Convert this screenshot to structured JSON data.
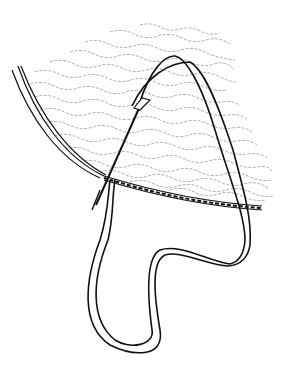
{
  "illustration": {
    "subject": "sewing bias binding strip along a curved fabric edge",
    "background_color": "#ffffff",
    "line_color": "#111111",
    "texture_color": "#8a8a8a",
    "elements": [
      "fabric-panel-with-wavy-texture",
      "folded-edge-left",
      "stitched-seam-line",
      "bias-strip-loop",
      "needle"
    ]
  }
}
